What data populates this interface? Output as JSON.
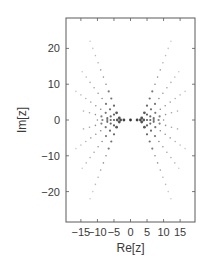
{
  "chart_data": {
    "type": "scatter",
    "title": "",
    "xlabel": "Re[z]",
    "ylabel": "Im[z]",
    "xlim": [
      -19.5,
      19.5
    ],
    "ylim": [
      -28.5,
      28.5
    ],
    "grid": false,
    "legend": null,
    "xticks": [
      -15,
      -10,
      -5,
      0,
      5,
      10,
      15
    ],
    "xtick_labels": [
      "−15",
      "−10",
      "−5",
      "0",
      "5",
      "10",
      "15"
    ],
    "yticks": [
      -20,
      -10,
      0,
      10,
      20
    ],
    "ytick_labels": [
      "−20",
      "−10",
      "0",
      "10",
      "20"
    ],
    "series": [
      {
        "name": "zeros",
        "symmetric": "points mirrored across both axes",
        "points_upper_left": [
          [
            -3.0,
            0.0
          ],
          [
            -3.4,
            0.6
          ],
          [
            -4.0,
            0.0
          ],
          [
            -5.0,
            0.0
          ],
          [
            -6.0,
            0.0
          ],
          [
            -7.0,
            0.0
          ],
          [
            -8.5,
            0.0
          ],
          [
            -10.0,
            0.0
          ],
          [
            -4.2,
            2.0
          ],
          [
            -5.0,
            4.0
          ],
          [
            -5.8,
            6.0
          ],
          [
            -6.6,
            8.0
          ],
          [
            -7.4,
            10.0
          ],
          [
            -8.2,
            12.0
          ],
          [
            -9.0,
            14.0
          ],
          [
            -9.8,
            16.0
          ],
          [
            -10.6,
            18.0
          ],
          [
            -11.4,
            20.0
          ],
          [
            -12.2,
            22.0
          ],
          [
            -5.0,
            1.5
          ],
          [
            -6.2,
            3.0
          ],
          [
            -7.4,
            4.5
          ],
          [
            -8.6,
            6.0
          ],
          [
            -9.8,
            7.5
          ],
          [
            -11.0,
            9.0
          ],
          [
            -12.2,
            10.5
          ],
          [
            -13.4,
            12.0
          ],
          [
            -14.6,
            13.5
          ],
          [
            -6.0,
            1.0
          ],
          [
            -7.5,
            2.0
          ],
          [
            -9.0,
            3.0
          ],
          [
            -10.5,
            4.0
          ],
          [
            -12.0,
            5.0
          ],
          [
            -13.5,
            6.0
          ],
          [
            -15.0,
            7.0
          ],
          [
            -16.5,
            8.0
          ],
          [
            -7.0,
            0.5
          ],
          [
            -8.8,
            1.0
          ],
          [
            -10.6,
            1.5
          ],
          [
            -12.4,
            2.0
          ],
          [
            -14.2,
            2.5
          ],
          [
            -2.0,
            0.0
          ]
        ],
        "center_point": [
          0.0,
          0.0
        ],
        "color": "#3c3c3c"
      }
    ]
  },
  "frame": {
    "left_px": 66,
    "top_px": 18,
    "right_px": 195,
    "bottom_px": 222
  },
  "colors": {
    "frame": "#5a5a5a",
    "point_dark": "#333333",
    "point_light": "#bdbdbd",
    "text": "#3a3a3a"
  }
}
